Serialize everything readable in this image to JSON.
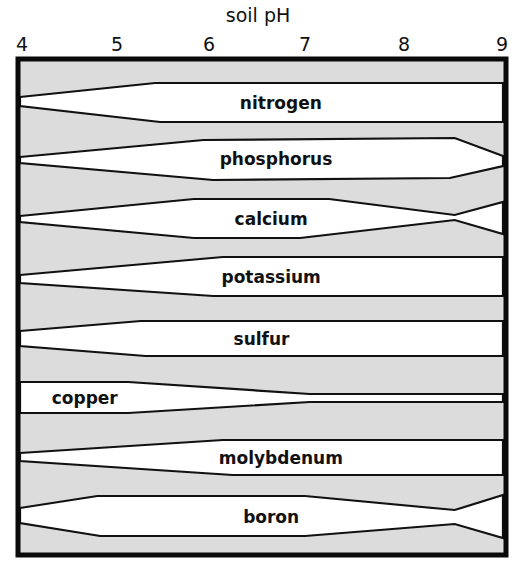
{
  "chart_data": {
    "type": "area",
    "title": "soil pH",
    "xlabel": "soil pH",
    "ylabel": "",
    "xlim": [
      4,
      9
    ],
    "x_ticks": [
      "4",
      "5",
      "6",
      "7",
      "8",
      "9"
    ],
    "grid": false,
    "legend": "none",
    "fill_color": "#dcdcdc",
    "band_color": "#ffffff",
    "line_color": "#111111",
    "series": [
      {
        "name": "nitrogen",
        "label_x_ph": 6.7,
        "top": [
          [
            4.0,
            97
          ],
          [
            5.4,
            83
          ],
          [
            9.0,
            83
          ]
        ],
        "bottom": [
          [
            4.0,
            106
          ],
          [
            5.45,
            122
          ],
          [
            9.0,
            122
          ]
        ],
        "relative_width": [
          [
            4.0,
            0.23
          ],
          [
            5.4,
            1.0
          ],
          [
            9.0,
            1.0
          ]
        ]
      },
      {
        "name": "phosphorus",
        "label_x_ph": 6.65,
        "top": [
          [
            4.0,
            157
          ],
          [
            5.9,
            140
          ],
          [
            8.5,
            138
          ],
          [
            9.0,
            156
          ]
        ],
        "bottom": [
          [
            4.0,
            163
          ],
          [
            6.0,
            180
          ],
          [
            8.45,
            178
          ],
          [
            9.0,
            166
          ]
        ],
        "relative_width": [
          [
            4.0,
            0.15
          ],
          [
            6.0,
            1.0
          ],
          [
            8.5,
            1.0
          ],
          [
            9.0,
            0.25
          ]
        ]
      },
      {
        "name": "calcium",
        "label_x_ph": 6.6,
        "top": [
          [
            4.0,
            216
          ],
          [
            5.8,
            199
          ],
          [
            7.2,
            199
          ],
          [
            8.5,
            215
          ],
          [
            9.0,
            202
          ]
        ],
        "bottom": [
          [
            4.0,
            222
          ],
          [
            5.8,
            238
          ],
          [
            6.9,
            238
          ],
          [
            8.5,
            220
          ],
          [
            9.0,
            234
          ]
        ],
        "relative_width": [
          [
            4.0,
            0.15
          ],
          [
            6.0,
            1.0
          ],
          [
            7.0,
            1.0
          ],
          [
            8.5,
            0.13
          ],
          [
            9.0,
            0.8
          ]
        ]
      },
      {
        "name": "potassium",
        "label_x_ph": 6.6,
        "top": [
          [
            4.0,
            275
          ],
          [
            6.1,
            257
          ],
          [
            9.0,
            257
          ]
        ],
        "bottom": [
          [
            4.0,
            283
          ],
          [
            6.0,
            296
          ],
          [
            9.0,
            296
          ]
        ],
        "relative_width": [
          [
            4.0,
            0.2
          ],
          [
            6.0,
            1.0
          ],
          [
            9.0,
            1.0
          ]
        ]
      },
      {
        "name": "sulfur",
        "label_x_ph": 6.5,
        "top": [
          [
            4.0,
            331
          ],
          [
            5.25,
            321
          ],
          [
            9.0,
            321
          ]
        ],
        "bottom": [
          [
            4.0,
            346
          ],
          [
            5.3,
            356
          ],
          [
            9.0,
            356
          ]
        ],
        "relative_width": [
          [
            4.0,
            0.43
          ],
          [
            5.3,
            1.0
          ],
          [
            9.0,
            1.0
          ]
        ]
      },
      {
        "name": "copper",
        "label_x_ph": 4.67,
        "top": [
          [
            4.0,
            382
          ],
          [
            5.12,
            382
          ],
          [
            7.0,
            394
          ],
          [
            9.0,
            394
          ]
        ],
        "bottom": [
          [
            4.0,
            413
          ],
          [
            5.12,
            413
          ],
          [
            7.0,
            402
          ],
          [
            9.0,
            402
          ]
        ],
        "relative_width": [
          [
            4.0,
            1.0
          ],
          [
            5.1,
            1.0
          ],
          [
            7.0,
            0.26
          ],
          [
            9.0,
            0.26
          ]
        ]
      },
      {
        "name": "molybdenum",
        "label_x_ph": 6.7,
        "top": [
          [
            4.0,
            453
          ],
          [
            6.1,
            440
          ],
          [
            9.0,
            440
          ]
        ],
        "bottom": [
          [
            4.0,
            461
          ],
          [
            6.2,
            475
          ],
          [
            9.0,
            475
          ]
        ],
        "relative_width": [
          [
            4.0,
            0.23
          ],
          [
            6.1,
            1.0
          ],
          [
            9.0,
            1.0
          ]
        ]
      },
      {
        "name": "boron",
        "label_x_ph": 6.6,
        "top": [
          [
            4.0,
            508
          ],
          [
            4.8,
            496
          ],
          [
            6.95,
            496
          ],
          [
            8.5,
            510
          ],
          [
            9.0,
            495
          ]
        ],
        "bottom": [
          [
            4.0,
            523
          ],
          [
            4.83,
            536
          ],
          [
            6.95,
            536
          ],
          [
            8.5,
            524
          ],
          [
            9.0,
            538
          ]
        ],
        "relative_width": [
          [
            4.0,
            0.38
          ],
          [
            4.8,
            1.0
          ],
          [
            7.0,
            1.0
          ],
          [
            8.5,
            0.35
          ],
          [
            9.0,
            1.0
          ]
        ]
      }
    ]
  },
  "layout": {
    "x_px_at_ph4": 20,
    "x_px_at_ph9": 503,
    "tick_px": [
      22,
      117,
      209,
      305,
      404,
      502
    ],
    "frame": {
      "x": 18,
      "y": 59,
      "w": 488,
      "h": 496
    }
  }
}
